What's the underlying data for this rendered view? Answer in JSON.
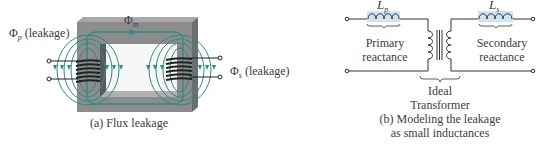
{
  "figure_a": {
    "caption": "(a) Flux leakage",
    "mutual_flux_symbol": "Φ",
    "mutual_flux_subscript": "m",
    "primary_leakage_symbol": "Φ",
    "primary_leakage_subscript": "p",
    "primary_leakage_text": "(leakage)",
    "secondary_leakage_symbol": "Φ",
    "secondary_leakage_subscript": "s",
    "secondary_leakage_text": "(leakage)"
  },
  "figure_b": {
    "caption_line1": "(b) Modeling the leakage",
    "caption_line2": "as small inductances",
    "primary_inductor_symbol": "L",
    "primary_inductor_subscript": "p",
    "secondary_inductor_symbol": "L",
    "secondary_inductor_subscript": "s",
    "primary_label_line1": "Primary",
    "primary_label_line2": "reactance",
    "secondary_label_line1": "Secondary",
    "secondary_label_line2": "reactance",
    "ideal_label_line1": "Ideal",
    "ideal_label_line2": "Transformer"
  },
  "colors": {
    "core": "#8c8c8c",
    "core_dark": "#6e6e6e",
    "flux": "#2e8a84",
    "wire": "#2a2a2a",
    "inductor_highlight": "#cfe3f3"
  }
}
